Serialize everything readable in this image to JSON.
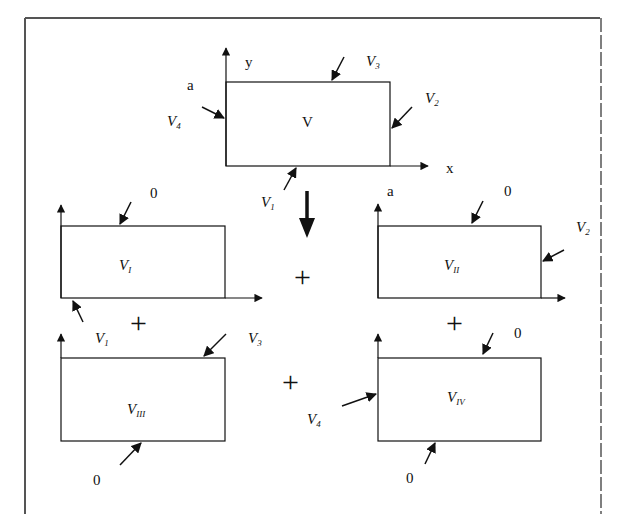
{
  "diagram": {
    "colors": {
      "ink": "#111111",
      "background": "#ffffff",
      "frame": "#555555"
    },
    "main": {
      "label": "V",
      "axis_x": "x",
      "axis_y": "y",
      "corner_a_left": "a",
      "boundaries": {
        "bottom": "V",
        "bottom_sub": "1",
        "right": "V",
        "right_sub": "2",
        "top": "V",
        "top_sub": "3",
        "left": "V",
        "left_sub": "4"
      }
    },
    "operator_plus": "+",
    "subproblems": [
      {
        "id": "I",
        "label": "V",
        "label_sub": "I",
        "top_value": "0",
        "bottom": "V",
        "bottom_sub": "1"
      },
      {
        "id": "II",
        "label": "V",
        "label_sub": "II",
        "corner": "a",
        "top_value": "0",
        "right": "V",
        "right_sub": "2"
      },
      {
        "id": "III",
        "label": "V",
        "label_sub": "III",
        "top": "V",
        "top_sub": "3",
        "bottom_value": "0"
      },
      {
        "id": "IV",
        "label": "V",
        "label_sub": "IV",
        "top_value": "0",
        "left": "V",
        "left_sub": "4",
        "bottom_value": "0"
      }
    ]
  }
}
